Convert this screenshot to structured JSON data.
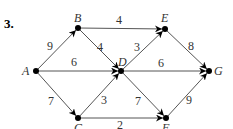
{
  "problem_number": "3.",
  "graph": {
    "type": "directed-weighted",
    "nodes": [
      {
        "id": "A",
        "label": "A",
        "x": 36,
        "y": 71,
        "lx": 22,
        "ly": 75
      },
      {
        "id": "B",
        "label": "B",
        "x": 78,
        "y": 28,
        "lx": 74,
        "ly": 22
      },
      {
        "id": "C",
        "label": "C",
        "x": 78,
        "y": 118,
        "lx": 74,
        "ly": 132
      },
      {
        "id": "D",
        "label": "D",
        "x": 121,
        "y": 71,
        "lx": 118,
        "ly": 66
      },
      {
        "id": "E",
        "label": "E",
        "x": 165,
        "y": 29,
        "lx": 161,
        "ly": 22
      },
      {
        "id": "F",
        "label": "F",
        "x": 166,
        "y": 118,
        "lx": 162,
        "ly": 132
      },
      {
        "id": "G",
        "label": "G",
        "x": 209,
        "y": 71,
        "lx": 214,
        "ly": 75
      }
    ],
    "edges": [
      {
        "from": "A",
        "to": "B",
        "weight": "9",
        "wx": 50,
        "wy": 50
      },
      {
        "from": "A",
        "to": "D",
        "weight": "6",
        "wx": 74,
        "wy": 66
      },
      {
        "from": "A",
        "to": "C",
        "weight": "7",
        "wx": 51,
        "wy": 105
      },
      {
        "from": "B",
        "to": "E",
        "weight": "4",
        "wx": 119,
        "wy": 24
      },
      {
        "from": "B",
        "to": "D",
        "weight": "4",
        "wx": 100,
        "wy": 51
      },
      {
        "from": "C",
        "to": "D",
        "weight": "3",
        "wx": 104,
        "wy": 104
      },
      {
        "from": "C",
        "to": "F",
        "weight": "2",
        "wx": 120,
        "wy": 129
      },
      {
        "from": "D",
        "to": "E",
        "weight": "3",
        "wx": 137,
        "wy": 51
      },
      {
        "from": "D",
        "to": "G",
        "weight": "6",
        "wx": 161,
        "wy": 67
      },
      {
        "from": "D",
        "to": "F",
        "weight": "7",
        "wx": 138,
        "wy": 105
      },
      {
        "from": "E",
        "to": "G",
        "weight": "8",
        "wx": 191,
        "wy": 50
      },
      {
        "from": "F",
        "to": "G",
        "weight": "9",
        "wx": 189,
        "wy": 104
      }
    ]
  }
}
